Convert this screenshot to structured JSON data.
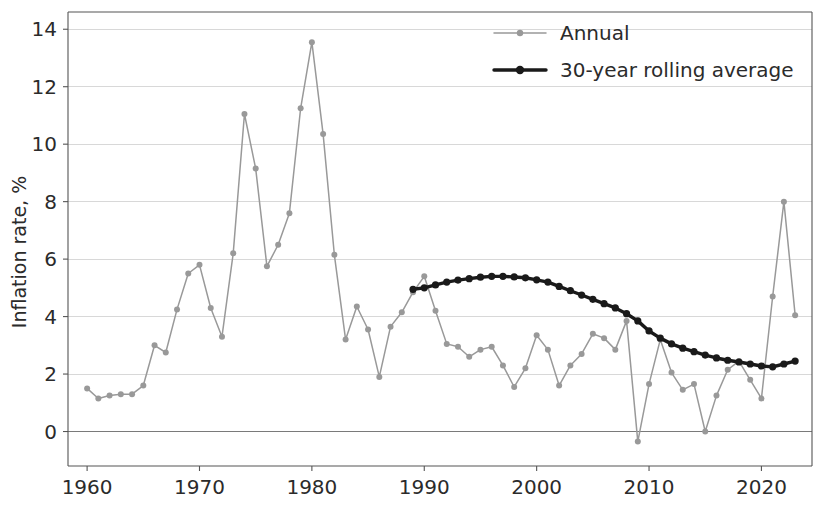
{
  "chart_data": {
    "type": "line",
    "title": "",
    "xlabel": "",
    "ylabel": "Inflation rate, %",
    "xlim": [
      1958.3,
      2024.5
    ],
    "ylim": [
      -1.2,
      14.6
    ],
    "xticks": [
      1960,
      1970,
      1980,
      1990,
      2000,
      2010,
      2020
    ],
    "yticks": [
      0,
      2,
      4,
      6,
      8,
      10,
      12,
      14
    ],
    "grid": true,
    "grid_axis": "y",
    "legend_position": "top-right",
    "colors": {
      "annual": "#999999",
      "rolling_average": "#1a1a1a",
      "gridline": "#d8d8d8",
      "axis": "#555555",
      "text": "#2b2b2b",
      "background": "#ffffff"
    },
    "series": [
      {
        "name": "Annual",
        "color": "#999999",
        "marker": "circle",
        "x": [
          1960,
          1961,
          1962,
          1963,
          1964,
          1965,
          1966,
          1967,
          1968,
          1969,
          1970,
          1971,
          1972,
          1973,
          1974,
          1975,
          1976,
          1977,
          1978,
          1979,
          1980,
          1981,
          1982,
          1983,
          1984,
          1985,
          1986,
          1987,
          1988,
          1989,
          1990,
          1991,
          1992,
          1993,
          1994,
          1995,
          1996,
          1997,
          1998,
          1999,
          2000,
          2001,
          2002,
          2003,
          2004,
          2005,
          2006,
          2007,
          2008,
          2009,
          2010,
          2011,
          2012,
          2013,
          2014,
          2015,
          2016,
          2017,
          2018,
          2019,
          2020,
          2021,
          2022,
          2023
        ],
        "values": [
          1.5,
          1.15,
          1.25,
          1.3,
          1.3,
          1.6,
          3.0,
          2.75,
          4.25,
          5.5,
          5.8,
          4.3,
          3.3,
          6.2,
          11.05,
          9.15,
          5.75,
          6.5,
          7.6,
          11.25,
          13.55,
          10.35,
          6.15,
          3.2,
          4.35,
          3.55,
          1.9,
          3.65,
          4.15,
          4.85,
          5.4,
          4.2,
          3.05,
          2.95,
          2.6,
          2.85,
          2.95,
          2.3,
          1.55,
          2.2,
          3.35,
          2.85,
          1.6,
          2.3,
          2.7,
          3.4,
          3.25,
          2.85,
          3.85,
          -0.35,
          1.65,
          3.2,
          2.05,
          1.45,
          1.65,
          0.0,
          1.25,
          2.15,
          2.45,
          1.8,
          1.15,
          4.7,
          8.0,
          4.05
        ]
      },
      {
        "name": "30-year rolling average",
        "color": "#1a1a1a",
        "marker": "circle",
        "x": [
          1989,
          1990,
          1991,
          1992,
          1993,
          1994,
          1995,
          1996,
          1997,
          1998,
          1999,
          2000,
          2001,
          2002,
          2003,
          2004,
          2005,
          2006,
          2007,
          2008,
          2009,
          2010,
          2011,
          2012,
          2013,
          2014,
          2015,
          2016,
          2017,
          2018,
          2019,
          2020,
          2021,
          2022,
          2023
        ],
        "values": [
          4.95,
          5.0,
          5.1,
          5.2,
          5.27,
          5.32,
          5.37,
          5.4,
          5.4,
          5.38,
          5.35,
          5.28,
          5.2,
          5.05,
          4.9,
          4.75,
          4.6,
          4.45,
          4.3,
          4.1,
          3.85,
          3.5,
          3.25,
          3.05,
          2.9,
          2.78,
          2.66,
          2.56,
          2.48,
          2.42,
          2.35,
          2.28,
          2.25,
          2.35,
          2.45
        ]
      }
    ]
  },
  "legend": {
    "items": [
      {
        "label": "Annual",
        "color": "#999999"
      },
      {
        "label": "30-year rolling average",
        "color": "#1a1a1a"
      }
    ]
  },
  "axes": {
    "y_title": "Inflation rate, %",
    "x_tick_labels": [
      "1960",
      "1970",
      "1980",
      "1990",
      "2000",
      "2010",
      "2020"
    ],
    "y_tick_labels": [
      "0",
      "2",
      "4",
      "6",
      "8",
      "10",
      "12",
      "14"
    ]
  }
}
